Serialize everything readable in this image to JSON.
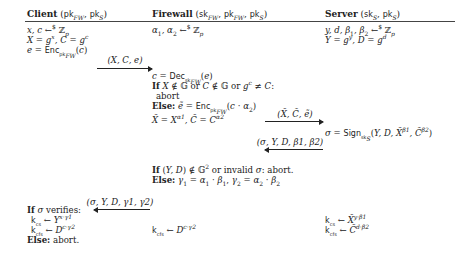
{
  "headers": {
    "client": {
      "name": "Client",
      "keys": "(pk_FW, pk_S)"
    },
    "firewall": {
      "name": "Firewall",
      "keys": "(sk_FW, pk_FW, pk_S)"
    },
    "server": {
      "name": "Server",
      "keys": "(sk_S, pk_S)"
    }
  },
  "client": {
    "lines": [
      "x, c ←$ Z_p",
      "X = g^x, C = g^c",
      "e = Enc_pk_FW(c)"
    ],
    "final": {
      "if": "If",
      "cond": "σ verifies:",
      "kcs": "k_cs ← Y^{x·γ1}",
      "kcfs": "k_cfs ← D^{c·γ2}",
      "else": "Else:",
      "else_text": "abort."
    }
  },
  "firewall": {
    "line1": "α1, α2 ←$ Z_p",
    "dec": "c = Dec_sk_FW(e)",
    "if_kw": "If",
    "if_cond": "X ∉ G or C ∉ G or g^c ≠ C:",
    "abort": "abort",
    "else_kw": "Else:",
    "else_enc": "ẽ = Enc_pk_FW(c · α2)",
    "blind": "X̃ = X^{α1}, C̃ = C^{α2}",
    "check_if": "If",
    "check_cond": "(Y, D) ∉ G² or invalid σ: abort.",
    "check_else": "Else:",
    "gammas": "γ1 = α1 · β1, γ2 = α2 · β2",
    "kcfs": "k_cfs ← D^{c·γ2}"
  },
  "server": {
    "line1": "y, d, β1, β2 ←$ Z_p",
    "line2": "Y = g^y, D = g^d",
    "sign": "σ = Sign_sk_S(Y, D, X̃^{β1}, C̃^{β2})",
    "kcs": "k_cs ← X̃^{y·β1}",
    "kcfs": "k_cfs ← C̃^{d·β2}"
  },
  "messages": [
    {
      "label": "(X, C, e)",
      "direction": "right",
      "from": "client",
      "to": "firewall"
    },
    {
      "label": "(X̃, C̃, ẽ)",
      "direction": "right",
      "from": "firewall",
      "to": "server"
    },
    {
      "label": "(σ, Y, D, β1, β2)",
      "direction": "left",
      "from": "server",
      "to": "firewall"
    },
    {
      "label": "(σ, Y, D, γ1, γ2)",
      "direction": "left",
      "from": "firewall",
      "to": "client"
    }
  ]
}
